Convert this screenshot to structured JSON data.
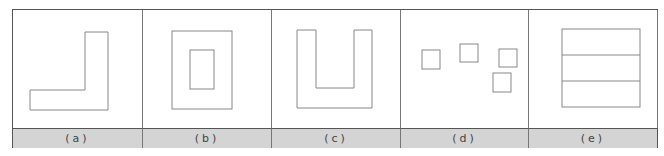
{
  "figure": {
    "panels": [
      {
        "label": "(a)",
        "shape": "L-shape"
      },
      {
        "label": "(b)",
        "shape": "nested-rectangles"
      },
      {
        "label": "(c)",
        "shape": "U-shape"
      },
      {
        "label": "(d)",
        "shape": "scattered-squares"
      },
      {
        "label": "(e)",
        "shape": "rectangle-three-horizontal-bands"
      }
    ]
  }
}
